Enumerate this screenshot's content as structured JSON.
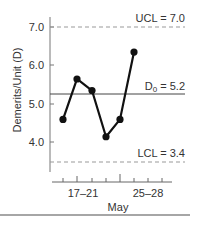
{
  "chart_data": {
    "type": "line",
    "title": "",
    "xlabel": "May",
    "ylabel": "Demerits/Unit (D)",
    "ylim": [
      3.2,
      7.3
    ],
    "yticks": [
      4.0,
      5.0,
      6.0,
      7.0
    ],
    "ytick_labels": [
      "4.0",
      "5.0",
      "6.0",
      "7.0"
    ],
    "x_tick_labels": [
      "17–21",
      "25–28"
    ],
    "x_tick_count": 8,
    "grid": false,
    "legend": null,
    "series": [
      {
        "name": "Demerits per unit",
        "x": [
          1,
          2,
          3,
          4,
          5,
          6
        ],
        "values": [
          4.6,
          5.65,
          5.35,
          4.15,
          4.6,
          6.35
        ],
        "marker": "filled-circle",
        "color": "#111111"
      }
    ],
    "reference_lines": [
      {
        "name": "UCL",
        "label": "UCL = 7.0",
        "value": 7.0,
        "style": "dashed"
      },
      {
        "name": "D0",
        "label_main": "D",
        "label_sub": "0",
        "label_rest": " = 5.2",
        "value": 5.2,
        "style": "solid"
      },
      {
        "name": "LCL",
        "label": "LCL = 3.4",
        "value": 3.4,
        "style": "dashed"
      }
    ]
  },
  "labels": {
    "ucl": "UCL = 7.0",
    "d0_main": "D",
    "d0_sub": "0",
    "d0_rest": " = 5.2",
    "lcl": "LCL = 3.4",
    "y7": "7.0",
    "y6": "6.0",
    "y5": "5.0",
    "y4": "4.0",
    "x_tick_1": "17–21",
    "x_tick_2": "25–28",
    "xlabel": "May",
    "ylabel": "Demerits/Unit (D)"
  }
}
